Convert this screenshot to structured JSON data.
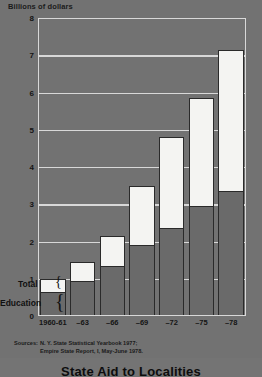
{
  "chart_data": {
    "type": "bar",
    "title": "State Aid to Localities",
    "ylabel": "Billions of dollars",
    "xlabel": "",
    "ylim": [
      0,
      8
    ],
    "yticks": [
      0,
      1,
      2,
      3,
      4,
      5,
      6,
      7,
      8
    ],
    "grid": true,
    "legend_position": "left-inside",
    "categories": [
      "1960-61",
      "–63",
      "–66",
      "–69",
      "–72",
      "–75",
      "–78"
    ],
    "series": [
      {
        "name": "Total",
        "values": [
          1.0,
          1.45,
          2.15,
          3.5,
          4.8,
          5.85,
          7.15
        ]
      },
      {
        "name": "Education",
        "values": [
          0.65,
          0.95,
          1.35,
          1.9,
          2.35,
          2.95,
          3.35
        ]
      }
    ],
    "annotations": [
      "Sources: N. Y. State Statistical Yearbook 1977;",
      "Empire State Report, I, May-June 1978."
    ]
  },
  "axis": {
    "caption": "Billions of dollars"
  },
  "legend": {
    "total_label": "Total",
    "education_label": "Education",
    "brace_glyph": "{"
  },
  "sources": {
    "label": "Sources:",
    "line1": "N. Y. State Statistical Yearbook 1977;",
    "line2": "Empire State Report, I, May-June 1978."
  },
  "title": {
    "text": "State Aid to Localities"
  },
  "colors": {
    "background": "#727272",
    "total_fill": "#f4f4f2",
    "education_fill": "#6a6a6a",
    "gridline": "#d8d8d8",
    "outline": "#2a2a2a",
    "text": "#141414"
  }
}
